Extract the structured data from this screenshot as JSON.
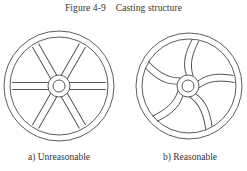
{
  "figure": {
    "title": "Figure 4-9    Casting structure",
    "panels": [
      {
        "id": "a",
        "caption": "a) Unreasonable",
        "description": "Wheel with six straight spokes"
      },
      {
        "id": "b",
        "caption": "b) Reasonable",
        "description": "Wheel with five curved spokes"
      }
    ],
    "colors": {
      "line": "#4a4a4a",
      "background": "#ffffff"
    }
  }
}
